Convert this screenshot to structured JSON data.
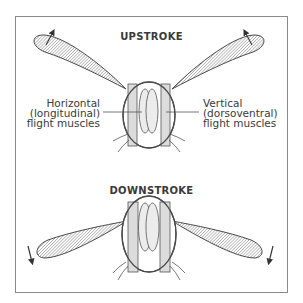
{
  "diagram": {
    "upstroke": {
      "title": "UPSTROKE",
      "left_label": {
        "line1": "Horizontal",
        "line2": "(longitudinal)",
        "line3": "flight muscles"
      },
      "right_label": {
        "line1": "Vertical",
        "line2": "(dorsoventral)",
        "line3": "flight muscles"
      },
      "arrow_direction": "up"
    },
    "downstroke": {
      "title": "DOWNSTROKE",
      "arrow_direction": "down"
    },
    "colors": {
      "outline": "#4a4a4a",
      "muscle_fill": "#dcdcdc",
      "wing_hatch": "#7a7a7a",
      "frame": "#8a8a8a",
      "background": "#ffffff"
    }
  }
}
